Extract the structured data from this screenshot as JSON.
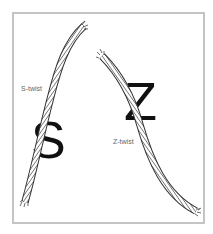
{
  "diagram": {
    "labels": {
      "s_twist": "S-twist",
      "z_twist": "Z-twist"
    },
    "letters": {
      "s": "S",
      "z": "Z"
    },
    "ropes": [
      {
        "name": "s-twist-rope",
        "stripe_direction": "backslash"
      },
      {
        "name": "z-twist-rope",
        "stripe_direction": "slash"
      }
    ],
    "colors": {
      "frame_border": "#c4c4c4",
      "letter": "#111111",
      "label": "#666666",
      "rope_stroke": "#333333",
      "rope_fill": "#ffffff"
    }
  }
}
